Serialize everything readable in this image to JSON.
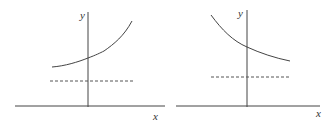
{
  "diagrams": [
    {
      "name": "increasing-curve",
      "y_label": "y",
      "x_label": "x",
      "curve": "increasing exponential above dashed asymptote"
    },
    {
      "name": "decreasing-curve",
      "y_label": "y",
      "x_label": "x",
      "curve": "decreasing exponential above dashed asymptote"
    }
  ],
  "colors": {
    "line": "#333333"
  }
}
